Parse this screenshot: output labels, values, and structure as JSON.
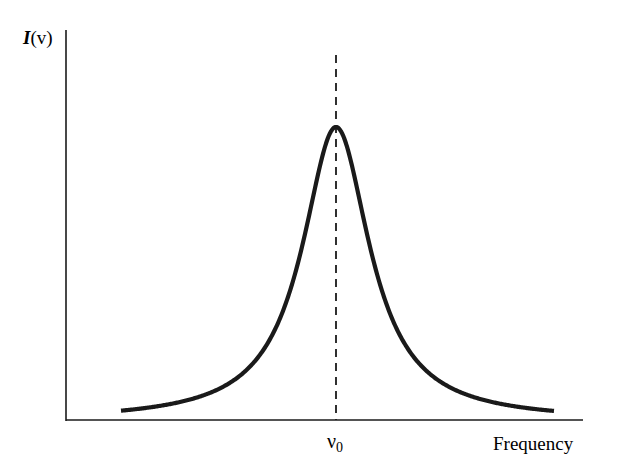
{
  "chart_data": {
    "type": "line",
    "title": "",
    "xlabel": "Frequency",
    "ylabel": "I(v)",
    "ylabel_parts": {
      "func": "I",
      "arg": "(v)"
    },
    "x_ticks": [
      {
        "label": "ν",
        "subscript": "0",
        "position": "center"
      }
    ],
    "y_ticks": [],
    "grid": false,
    "legend": null,
    "series": [
      {
        "name": "Lorentzian line profile",
        "shape": "lorentzian",
        "center": "ν0",
        "x": [
          -5,
          -4,
          -3,
          -2,
          -1.5,
          -1,
          -0.5,
          0,
          0.5,
          1,
          1.5,
          2,
          3,
          4,
          5
        ],
        "values": [
          0.04,
          0.06,
          0.1,
          0.2,
          0.31,
          0.5,
          0.8,
          1.0,
          0.8,
          0.5,
          0.31,
          0.2,
          0.1,
          0.06,
          0.04
        ],
        "units": "x in half-widths from ν0; y normalized to peak"
      }
    ],
    "annotations": [
      {
        "type": "vertical-dashed-line",
        "at": "ν0"
      }
    ],
    "colors": {
      "curve": "#1a1a1a",
      "axes": "#1a1a1a",
      "background": "#ffffff"
    }
  }
}
